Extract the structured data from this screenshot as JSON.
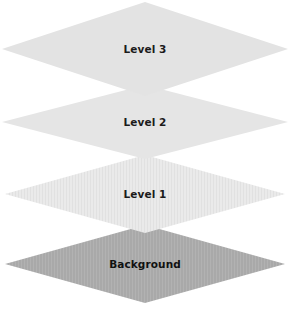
{
  "diagram": {
    "type": "layered-plane-stack",
    "background_color": "#ffffff",
    "width": 290,
    "height": 309,
    "title": "",
    "layers": [
      {
        "id": "level3",
        "label": "Level 3",
        "order": 4,
        "position": "top",
        "fill_color": "#e3e3e3",
        "texture": "none",
        "label_color": "#1b1b1b",
        "center_y": 49,
        "half_width": 143,
        "half_height": 47
      },
      {
        "id": "level2",
        "label": "Level 2",
        "order": 3,
        "position": "upper-middle",
        "fill_color": "#e5e5e5",
        "texture": "none",
        "label_color": "#1b1b1b",
        "center_y": 122,
        "half_width": 143,
        "half_height": 37
      },
      {
        "id": "level1",
        "label": "Level 1",
        "order": 2,
        "position": "lower-middle",
        "fill_color": "#e9e9e9",
        "texture": "vertical-stripes",
        "label_color": "#1b1b1b",
        "center_y": 194,
        "half_width": 140,
        "half_height": 39
      },
      {
        "id": "background",
        "label": "Background",
        "order": 1,
        "position": "bottom",
        "fill_color": "#a9a9a9",
        "texture": "vertical-stripes",
        "label_color": "#111111",
        "center_y": 264,
        "half_width": 140,
        "half_height": 39
      }
    ]
  }
}
